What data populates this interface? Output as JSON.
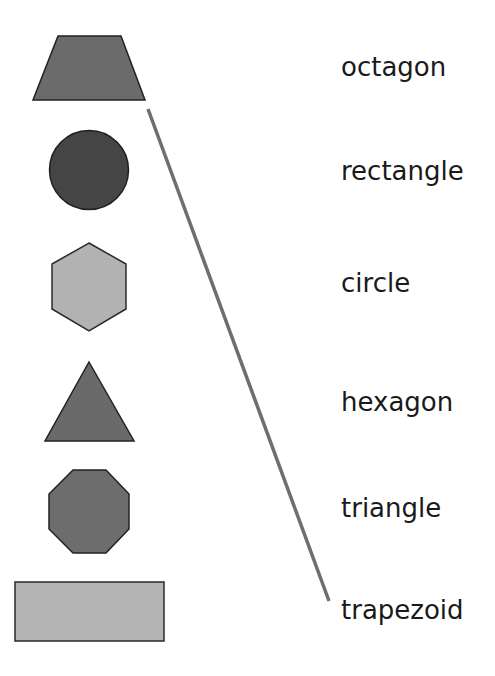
{
  "worksheet": {
    "shapes": [
      {
        "id": "trapezoid",
        "name": "trapezoid",
        "fill": "#6b6b6b",
        "stroke": "#222222"
      },
      {
        "id": "circle",
        "name": "circle",
        "fill": "#454545",
        "stroke": "#1f1f1f"
      },
      {
        "id": "hexagon",
        "name": "hexagon",
        "fill": "#b2b2b2",
        "stroke": "#2a2a2a"
      },
      {
        "id": "triangle",
        "name": "triangle",
        "fill": "#6a6a6a",
        "stroke": "#222222"
      },
      {
        "id": "octagon",
        "name": "octagon",
        "fill": "#6d6d6d",
        "stroke": "#222222"
      },
      {
        "id": "rectangle",
        "name": "rectangle",
        "fill": "#b4b4b4",
        "stroke": "#2a2a2a"
      }
    ],
    "labels": [
      {
        "text": "octagon"
      },
      {
        "text": "rectangle"
      },
      {
        "text": "circle"
      },
      {
        "text": "hexagon"
      },
      {
        "text": "triangle"
      },
      {
        "text": "trapezoid"
      }
    ],
    "connections": [
      {
        "from": "trapezoid",
        "to": "trapezoid",
        "color": "#6e6e6e"
      }
    ]
  }
}
